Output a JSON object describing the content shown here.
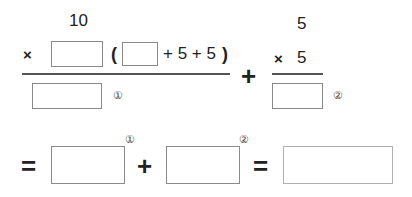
{
  "worksheet": {
    "left_fraction": {
      "multiplicand": "10",
      "times_sign": "×",
      "open_paren": "(",
      "expression_tail": "+ 5 + 5",
      "close_paren": ")",
      "label": "①",
      "answer_box_value": ""
    },
    "plus_sign": "+",
    "right_fraction": {
      "multiplicand": "5",
      "times_sign": "×",
      "multiplier": "5",
      "label": "②",
      "answer_box_value": ""
    },
    "bottom_row": {
      "equals_1": "=",
      "box_1_label": "①",
      "plus": "+",
      "box_2_label": "②",
      "equals_2": "=",
      "box_1_value": "",
      "box_2_value": "",
      "result_value": ""
    }
  }
}
